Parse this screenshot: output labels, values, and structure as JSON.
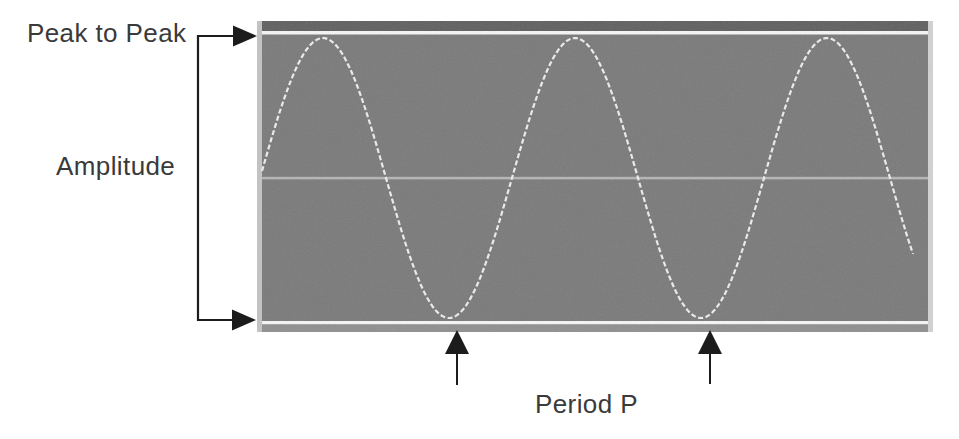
{
  "page": {
    "background": "#ffffff",
    "text_color": "#3a3a3a"
  },
  "labels": {
    "peak_to_peak": "Peak to Peak",
    "amplitude": "Amplitude",
    "period": "Period P"
  },
  "annotation_color": "#1c1c1c",
  "scope": {
    "body_color": "#7a7a7a",
    "edge_color": "#c3c3c3",
    "right_edge_color": "#d2d2d2",
    "top_band_color": "#606060",
    "bottom_band_color": "#8f8f8f",
    "line_color": "#f6f6f6",
    "center_line_color": "#b5b5b5",
    "wave_color": "#ededed"
  },
  "chart_data": {
    "type": "line",
    "title": "",
    "annotations": [
      "Peak to Peak",
      "Amplitude",
      "Period P"
    ],
    "wave": {
      "shape": "sine",
      "cycles_shown": 2.6,
      "period_px": 252,
      "amplitude_px": 140,
      "center_y_px": 157,
      "phase_zero_x_px": 3,
      "start_x_px": 5,
      "end_x_px": 658,
      "step_px": 3,
      "dash": [
        5,
        2.5
      ],
      "trough_marker_x_px": [
        457,
        710
      ]
    },
    "legend": null,
    "grid": false
  }
}
